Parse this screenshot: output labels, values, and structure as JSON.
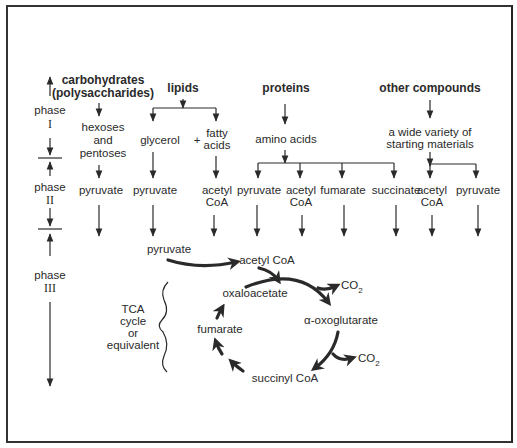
{
  "phases": [
    {
      "label": "phase",
      "numeral": "I"
    },
    {
      "label": "phase",
      "numeral": "II"
    },
    {
      "label": "phase",
      "numeral": "III"
    }
  ],
  "sources": {
    "carbohydrates": {
      "line1": "carbohydrates",
      "line2": "(polysaccharides)"
    },
    "lipids": "lipids",
    "proteins": "proteins",
    "other": "other compounds"
  },
  "phase1_products": {
    "hexoses": [
      "hexoses",
      "and",
      "pentoses"
    ],
    "glycerol": "glycerol",
    "plus": "+",
    "fatty_acids": [
      "fatty",
      "acids"
    ],
    "amino_acids": "amino  acids",
    "wide_variety": [
      "a wide  variety  of",
      "starting  materials"
    ]
  },
  "phase2_products": [
    {
      "id": "carb-pyruvate",
      "lines": [
        "pyruvate"
      ]
    },
    {
      "id": "glycerol-pyruvate",
      "lines": [
        "pyruvate"
      ]
    },
    {
      "id": "fatty-acetylcoa",
      "lines": [
        "acetyl",
        "CoA"
      ]
    },
    {
      "id": "amino-pyruvate",
      "lines": [
        "pyruvate"
      ]
    },
    {
      "id": "amino-acetylcoa",
      "lines": [
        "acetyl",
        "CoA"
      ]
    },
    {
      "id": "amino-fumarate",
      "lines": [
        "fumarate"
      ]
    },
    {
      "id": "amino-succinate",
      "lines": [
        "succinate"
      ]
    },
    {
      "id": "other-acetylcoa",
      "lines": [
        "acetyl",
        "CoA"
      ]
    },
    {
      "id": "other-pyruvate",
      "lines": [
        "pyruvate"
      ]
    }
  ],
  "phase3": {
    "pyruvate": "pyruvate",
    "acetyl_coa": "acetyl  CoA",
    "oxaloacetate": "oxaloacetate",
    "alpha_oxoglutarate": "α-oxoglutarate",
    "fumarate": "fumarate",
    "succinyl_coa": "succinyl  CoA",
    "co2_1": "CO",
    "co2_2": "CO",
    "co2_sub": "2",
    "tca_label": [
      "TCA",
      "cycle",
      "or",
      "equivalent"
    ]
  },
  "colors": {
    "ink": "#2a2a2a",
    "background": "#ffffff"
  }
}
